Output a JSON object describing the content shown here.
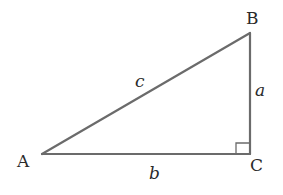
{
  "diagram": {
    "type": "right-triangle",
    "stroke_color": "#6b6b6b",
    "label_color": "#2a2a2a",
    "background": "#ffffff",
    "vertices": {
      "A": {
        "label": "A",
        "x": 42,
        "y": 154
      },
      "B": {
        "label": "B",
        "x": 250,
        "y": 33
      },
      "C": {
        "label": "C",
        "x": 250,
        "y": 154
      }
    },
    "sides": {
      "a": {
        "label": "a",
        "between": [
          "B",
          "C"
        ]
      },
      "b": {
        "label": "b",
        "between": [
          "A",
          "C"
        ]
      },
      "c": {
        "label": "c",
        "between": [
          "A",
          "B"
        ]
      }
    },
    "right_angle_at": "C"
  }
}
